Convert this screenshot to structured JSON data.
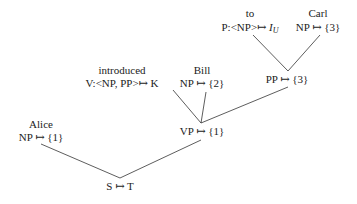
{
  "nodes": {
    "to": {
      "word": "to",
      "cat": "P:<NP>↦ ",
      "sem": "I",
      "sub": "U"
    },
    "carl": {
      "word": "Carl",
      "label": "NP ↦ {3}"
    },
    "pp": {
      "label": "PP ↦ {3}"
    },
    "introduced": {
      "word": "introduced",
      "label": "V:<NP, PP>↦ K"
    },
    "bill": {
      "word": "Bill",
      "label": "NP ↦ {2}"
    },
    "vp": {
      "label": "VP ↦ {1}"
    },
    "alice": {
      "word": "Alice",
      "label": "NP ↦ {1}"
    },
    "s": {
      "label": "S ↦ T"
    }
  },
  "edges": [
    {
      "from": "to",
      "to": "pp"
    },
    {
      "from": "carl",
      "to": "pp"
    },
    {
      "from": "introduced",
      "to": "vp"
    },
    {
      "from": "bill",
      "to": "vp"
    },
    {
      "from": "pp",
      "to": "vp"
    },
    {
      "from": "alice",
      "to": "s"
    },
    {
      "from": "vp",
      "to": "s"
    }
  ],
  "colors": {
    "text": "#222222",
    "line": "#333333",
    "background": "#ffffff"
  }
}
